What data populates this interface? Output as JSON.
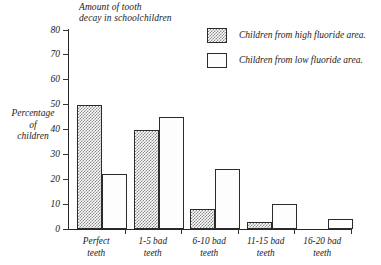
{
  "chart_data": {
    "type": "bar",
    "title": "Amount of tooth decay in schoolchildren",
    "title_lines": [
      "Amount of tooth",
      "decay in schoolchildren"
    ],
    "xlabel": "",
    "ylabel": "Percentage of children",
    "ylabel_lines": [
      "Percentage",
      "of",
      "children"
    ],
    "ylim": [
      0,
      80
    ],
    "y_ticks": [
      0,
      10,
      20,
      30,
      40,
      50,
      60,
      70,
      80
    ],
    "y_tick_labels": [
      "0",
      "10",
      "20",
      "30",
      "40",
      "50",
      "60",
      "70",
      "80"
    ],
    "grid": false,
    "legend_position": "top-right",
    "categories": [
      "Perfect teeth",
      "1-5 bad teeth",
      "6-10 bad teeth",
      "11-15 bad teeth",
      "16-20 bad teeth"
    ],
    "category_lines": [
      [
        "Perfect",
        "teeth"
      ],
      [
        "1-5 bad",
        "teeth"
      ],
      [
        "6-10 bad",
        "teeth"
      ],
      [
        "11-15 bad",
        "teeth"
      ],
      [
        "16-20 bad",
        "teeth"
      ]
    ],
    "series": [
      {
        "name": "Children from high fluoride area.",
        "fill": "checkered-grey",
        "values": [
          50,
          40,
          8,
          3,
          0
        ]
      },
      {
        "name": "Children from low fluoride area.",
        "fill": "white",
        "values": [
          22,
          45,
          24,
          10,
          4
        ]
      }
    ]
  },
  "legend": {
    "items": [
      {
        "label": "Children from high fluoride area.",
        "swatch": "checkered-grey-swatch"
      },
      {
        "label": "Children from low fluoride area.",
        "swatch": "white-swatch"
      }
    ]
  },
  "colors": {
    "axis": "#262626",
    "bar_outline": "#2b2b2b",
    "stipple": "#8a8a8a",
    "background": "#ffffff",
    "text": "#1a1a1a"
  }
}
